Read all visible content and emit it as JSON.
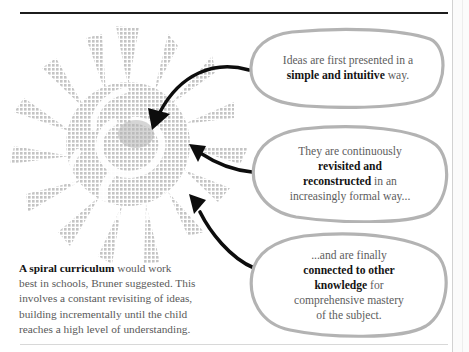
{
  "page": {
    "background_color": "#ffffff",
    "rule_color": "#1c1c1c",
    "bubble_stroke_color": "#b3b3b3",
    "arrow_color": "#0d0d0d",
    "graphic_color": "#c9c9c9",
    "text_color": "#5a5a5a",
    "bold_text_color": "#141414"
  },
  "graphic": {
    "name": "spiral-starburst",
    "description": "halftone grey starburst / spiral shape with radiating spikes"
  },
  "bubbles": [
    {
      "id": "bubble-1",
      "lines": [
        [
          {
            "text": "Ideas are first presented in a",
            "bold": false
          }
        ],
        [
          {
            "text": "simple and intuitive",
            "bold": true
          },
          {
            "text": " way.",
            "bold": false
          }
        ]
      ]
    },
    {
      "id": "bubble-2",
      "lines": [
        [
          {
            "text": "They are continuously",
            "bold": false
          }
        ],
        [
          {
            "text": "revisited and",
            "bold": true
          }
        ],
        [
          {
            "text": "reconstructed",
            "bold": true
          },
          {
            "text": " in an",
            "bold": false
          }
        ],
        [
          {
            "text": "increasingly formal way...",
            "bold": false
          }
        ]
      ]
    },
    {
      "id": "bubble-3",
      "lines": [
        [
          {
            "text": "...and are finally",
            "bold": false
          }
        ],
        [
          {
            "text": "connected to other",
            "bold": true
          }
        ],
        [
          {
            "text": "knowledge",
            "bold": true
          },
          {
            "text": " for",
            "bold": false
          }
        ],
        [
          {
            "text": "comprehensive mastery",
            "bold": false
          }
        ],
        [
          {
            "text": "of the subject.",
            "bold": false
          }
        ]
      ]
    }
  ],
  "caption": {
    "lines": [
      [
        {
          "text": "A spiral curriculum",
          "bold": true
        },
        {
          "text": " would work",
          "bold": false
        }
      ],
      [
        {
          "text": "best in schools, Bruner suggested. This",
          "bold": false
        }
      ],
      [
        {
          "text": "involves a constant revisiting of ideas,",
          "bold": false
        }
      ],
      [
        {
          "text": "building incrementally until the child",
          "bold": false
        }
      ],
      [
        {
          "text": "reaches a high level of understanding.",
          "bold": false
        }
      ]
    ]
  },
  "arrows": [
    {
      "id": "arrow-to-center",
      "from": "bubble-1",
      "direction": "down-left"
    },
    {
      "id": "arrow-to-mid-right",
      "from": "bubble-2",
      "direction": "up-left"
    },
    {
      "id": "arrow-to-lower-right",
      "from": "bubble-3",
      "direction": "up-left"
    }
  ]
}
